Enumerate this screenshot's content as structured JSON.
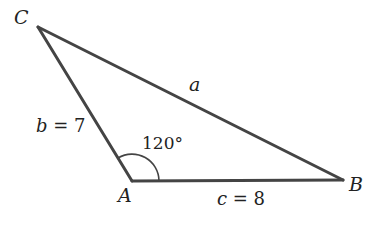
{
  "diagram": {
    "type": "triangle",
    "line_color": "#444444",
    "vertices": [
      {
        "name": "C",
        "x": 38,
        "y": 27
      },
      {
        "name": "A",
        "x": 132,
        "y": 181
      },
      {
        "name": "B",
        "x": 343,
        "y": 180
      }
    ],
    "labels": {
      "vertex_c": "C",
      "vertex_a": "A",
      "vertex_b": "B",
      "side_a": "a",
      "side_b_var": "b",
      "side_b_eq": " = 7",
      "side_c_var": "c",
      "side_c_eq": " = 8",
      "angle_a": "120°"
    },
    "sides": [
      {
        "name": "a",
        "from": "C",
        "to": "B",
        "value": null
      },
      {
        "name": "b",
        "from": "A",
        "to": "C",
        "value": 7
      },
      {
        "name": "c",
        "from": "A",
        "to": "B",
        "value": 8
      }
    ],
    "angles": [
      {
        "vertex": "A",
        "degrees": 120
      }
    ]
  }
}
